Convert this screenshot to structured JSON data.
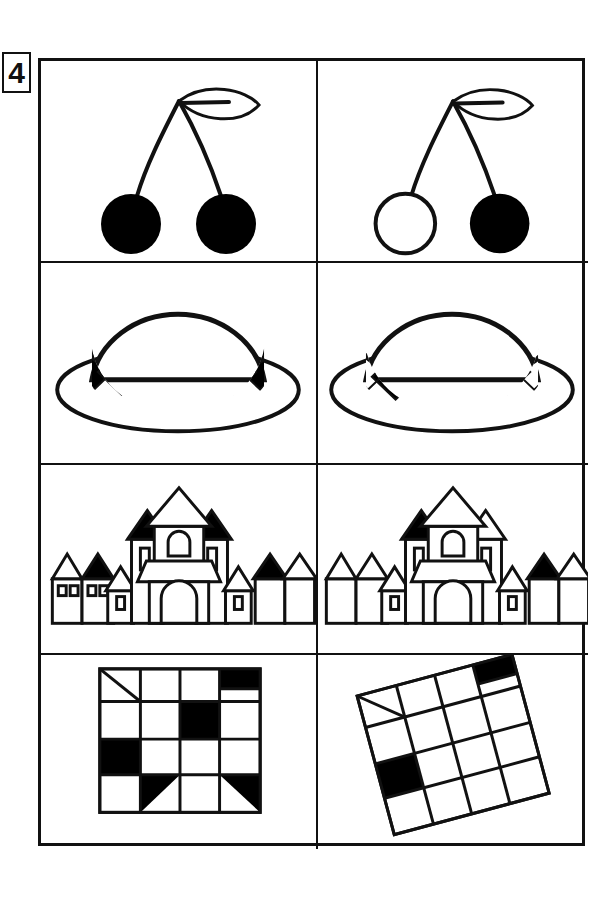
{
  "worksheet": {
    "exercise_number": "4",
    "type": "spot-the-difference",
    "columns": 2,
    "rows": 4,
    "stroke_color": "#111111",
    "fill_color": "#000000",
    "background_color": "#ffffff"
  },
  "rows": [
    {
      "subject": "cherries",
      "left": {
        "label": "cherries-left",
        "cherry_left_filled": true,
        "cherry_right_filled": true,
        "leaf": "single-leaf-right"
      },
      "right": {
        "label": "cherries-right",
        "cherry_left_filled": false,
        "cherry_right_filled": true,
        "leaf": "single-leaf-right"
      }
    },
    {
      "subject": "hat",
      "left": {
        "label": "hat-left",
        "band_diamonds": 7,
        "band_filled_pattern": [
          true,
          false,
          true,
          false,
          true,
          false,
          true
        ]
      },
      "right": {
        "label": "hat-right",
        "band_diamonds": 7,
        "band_filled_pattern": [
          false,
          true,
          false,
          true,
          false,
          false,
          false
        ]
      }
    },
    {
      "subject": "castle",
      "left": {
        "label": "castle-left",
        "house_far_left_roofs": [
          false,
          true
        ],
        "house_far_left_windows": 4,
        "small_tower_left_window": true,
        "tower_left_roof_filled": true,
        "tower_right_roof_filled": true,
        "center_roof_filled": false,
        "small_tower_right_window": true,
        "house_far_right_roofs": [
          true,
          false
        ]
      },
      "right": {
        "label": "castle-right",
        "house_far_left_roofs": [
          false,
          false
        ],
        "house_far_left_windows": 0,
        "small_tower_left_window": true,
        "tower_left_roof_filled": true,
        "tower_right_roof_filled": false,
        "center_roof_filled": false,
        "small_tower_right_window": true,
        "house_far_right_roofs": [
          true,
          false
        ]
      }
    },
    {
      "subject": "checkerboard",
      "left": {
        "label": "checkerboard-left",
        "rotation_degrees": 0,
        "grid_columns": 4,
        "grid_rows": 4,
        "cells": [
          [
            "diagonal",
            "white",
            "white",
            "black-top-half"
          ],
          [
            "white",
            "white",
            "black",
            "white"
          ],
          [
            "black",
            "white",
            "white",
            "white"
          ],
          [
            "white",
            "triangle-black-upper-left",
            "white",
            "triangle-black-upper-right"
          ]
        ]
      },
      "right": {
        "label": "checkerboard-right",
        "rotation_degrees": -15,
        "grid_columns": 4,
        "grid_rows": 4,
        "cells": [
          [
            "diagonal",
            "white",
            "white",
            "black-top-half"
          ],
          [
            "white",
            "white",
            "white",
            "white"
          ],
          [
            "black",
            "white",
            "white",
            "white"
          ],
          [
            "white",
            "white",
            "white",
            "white"
          ]
        ]
      }
    }
  ]
}
